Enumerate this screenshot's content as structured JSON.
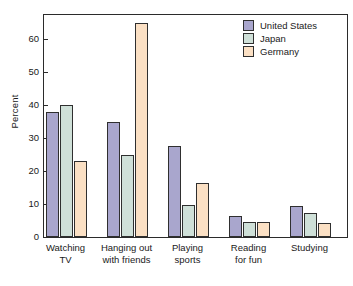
{
  "chart_data": {
    "type": "bar",
    "title": "",
    "xlabel": "",
    "ylabel": "Percent",
    "ylim": [
      0,
      68
    ],
    "yticks": [
      0,
      10,
      20,
      30,
      40,
      50,
      60
    ],
    "ytick_labels": [
      "0",
      "10",
      "20",
      "30",
      "40",
      "50",
      "60"
    ],
    "grid": false,
    "legend_position": "top-right",
    "categories": [
      "Watching TV",
      "Hanging out with friends",
      "Playing sports",
      "Reading for fun",
      "Studying"
    ],
    "category_lines": [
      [
        "Watching",
        "TV"
      ],
      [
        "Hanging out",
        "with friends"
      ],
      [
        "Playing",
        "sports"
      ],
      [
        "Reading",
        "for fun"
      ],
      [
        "Studying",
        ""
      ]
    ],
    "series": [
      {
        "name": "United States",
        "color": "#a9a6cd",
        "values": [
          38,
          35,
          27.5,
          6.5,
          9.5
        ]
      },
      {
        "name": "Japan",
        "color": "#cfe0d8",
        "values": [
          40,
          25,
          9.8,
          4.5,
          7.3
        ]
      },
      {
        "name": "Germany",
        "color": "#fbe0c4",
        "values": [
          23,
          65,
          16.5,
          4.5,
          4.3
        ]
      }
    ]
  },
  "colors": {
    "united_states": "#a9a6cd",
    "japan": "#cfe0d8",
    "germany": "#fbe0c4",
    "axis": "#2b2b2b",
    "bar_outline": "#2f2f2f",
    "text": "#1a1a1a",
    "background": "#ffffff"
  }
}
